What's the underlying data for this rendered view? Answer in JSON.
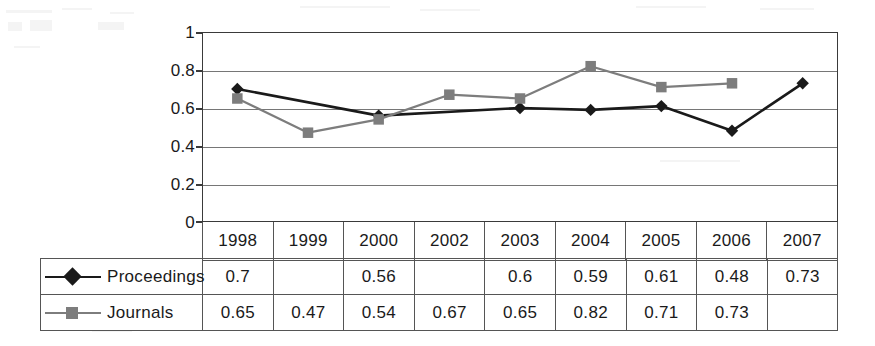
{
  "chart_data": {
    "type": "line",
    "title": "",
    "xlabel": "",
    "ylabel": "",
    "categories": [
      "1998",
      "1999",
      "2000",
      "2002",
      "2003",
      "2004",
      "2005",
      "2006",
      "2007"
    ],
    "ylim": [
      0,
      1
    ],
    "y_ticks": [
      "1",
      "0.8",
      "0.6",
      "0.4",
      "0.2",
      "0"
    ],
    "y_tick_values": [
      1,
      0.8,
      0.6,
      0.4,
      0.2,
      0
    ],
    "grid": true,
    "legend_position": "data-table-below",
    "series": [
      {
        "name": "Proceedings",
        "marker": "diamond",
        "color": "#1a1a1a",
        "values": [
          0.7,
          null,
          0.56,
          null,
          0.6,
          0.59,
          0.61,
          0.48,
          0.73
        ],
        "display_values": [
          "0.7",
          "",
          "0.56",
          "",
          "0.6",
          "0.59",
          "0.61",
          "0.48",
          "0.73"
        ]
      },
      {
        "name": "Journals",
        "marker": "square",
        "color": "#7d7d7d",
        "values": [
          0.65,
          0.47,
          0.54,
          0.67,
          0.65,
          0.82,
          0.71,
          0.73,
          null
        ],
        "display_values": [
          "0.65",
          "0.47",
          "0.54",
          "0.67",
          "0.65",
          "0.82",
          "0.71",
          "0.73",
          ""
        ]
      }
    ]
  },
  "colors": {
    "proceedings": "#1a1a1a",
    "journals": "#7d7d7d",
    "plot_border": "#3a3a3a",
    "gridline": "#767676",
    "table_border": "#555555",
    "background": "#ffffff"
  }
}
